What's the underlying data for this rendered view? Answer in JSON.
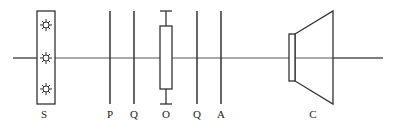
{
  "diagram": {
    "type": "optical-bench",
    "colors": {
      "stroke": "#333333",
      "axis": "#555555",
      "background": "#ffffff"
    },
    "components": [
      {
        "id": "S",
        "label": "S",
        "x": 46,
        "kind": "light-source"
      },
      {
        "id": "P",
        "label": "P",
        "x": 110,
        "kind": "polarizer"
      },
      {
        "id": "Q1",
        "label": "Q",
        "x": 134,
        "kind": "quarter-wave-plate"
      },
      {
        "id": "O",
        "label": "O",
        "x": 166,
        "kind": "sample-holder"
      },
      {
        "id": "Q2",
        "label": "Q",
        "x": 197,
        "kind": "quarter-wave-plate"
      },
      {
        "id": "A",
        "label": "A",
        "x": 221,
        "kind": "analyzer"
      },
      {
        "id": "C",
        "label": "C",
        "x": 313,
        "kind": "camera"
      }
    ]
  }
}
